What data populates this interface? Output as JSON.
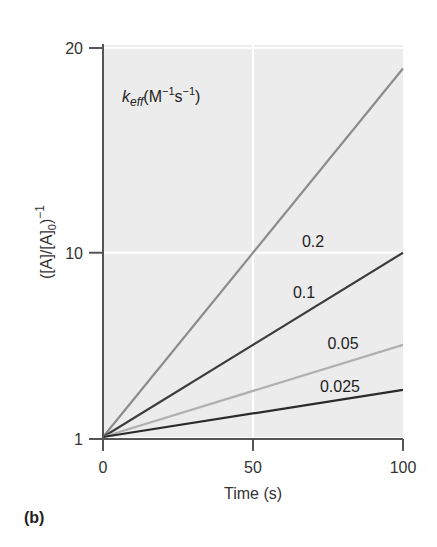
{
  "panel_label": "(b)",
  "chart_data": {
    "type": "line",
    "title": "",
    "xlabel": "Time (s)",
    "ylabel": "([A]/[A]0)^-1",
    "ylabel_parts": {
      "main": "([A]/[A]",
      "sub": "0",
      "close": ")",
      "sup": "−1"
    },
    "legend_title": {
      "k": "k",
      "sub": "eff",
      "rest": "(M",
      "sup1": "−1",
      "s": "s",
      "sup2": "−1",
      "close": ")"
    },
    "xlim": [
      0,
      100
    ],
    "ylim": [
      1,
      20
    ],
    "xticks": [
      0,
      50,
      100
    ],
    "xtick_labels": [
      "0",
      "50",
      "100"
    ],
    "yticks": [
      1,
      10,
      20
    ],
    "ytick_labels": [
      "1",
      "10",
      "20"
    ],
    "grid": {
      "x": [
        50
      ],
      "y": [
        10,
        20
      ],
      "color": "#ffffff"
    },
    "background": "#ececec",
    "series": [
      {
        "name": "0.2",
        "x": [
          0,
          100
        ],
        "values": [
          1,
          19
        ],
        "color": "#8c8c8c",
        "label_pos": [
          70,
          10.3
        ]
      },
      {
        "name": "0.1",
        "x": [
          0,
          100
        ],
        "values": [
          1,
          10
        ],
        "color": "#3c3c3c",
        "label_pos": [
          67,
          7.8
        ]
      },
      {
        "name": "0.05",
        "x": [
          0,
          100
        ],
        "values": [
          1,
          5.5
        ],
        "color": "#b0b0b0",
        "label_pos": [
          80,
          5.3
        ]
      },
      {
        "name": "0.025",
        "x": [
          0,
          100
        ],
        "values": [
          1,
          3.3
        ],
        "color": "#2a2a2a",
        "label_pos": [
          79,
          3.2
        ]
      }
    ]
  }
}
